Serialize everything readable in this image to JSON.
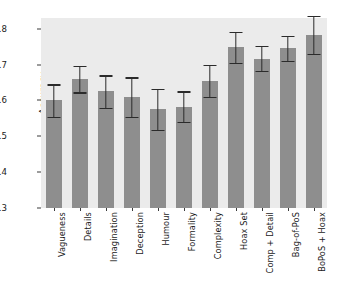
{
  "chart_data": {
    "type": "bar",
    "title": "",
    "xlabel": "",
    "ylabel": "Accuracy",
    "ylim": [
      0.3,
      0.83
    ],
    "yticks": [
      0.3,
      0.4,
      0.5,
      0.6,
      0.7,
      0.8
    ],
    "ytick_labels": [
      "0.3",
      "0.4",
      "0.5",
      "0.6",
      "0.7",
      "0.8"
    ],
    "grid": false,
    "legend": null,
    "categories": [
      "Vagueness",
      "Details",
      "Imagination",
      "Deception",
      "Humour",
      "Formality",
      "Complexity",
      "Hoax Set",
      "Comp + Detail",
      "Bag-of-PoS",
      "BoPoS + Hoax"
    ],
    "values": [
      0.6,
      0.66,
      0.625,
      0.61,
      0.575,
      0.583,
      0.655,
      0.748,
      0.717,
      0.745,
      0.783
    ],
    "errors": [
      0.045,
      0.037,
      0.045,
      0.055,
      0.057,
      0.042,
      0.045,
      0.043,
      0.035,
      0.035,
      0.053
    ],
    "bar_color": "#8e8e8e",
    "error_color": "#2b2b2b",
    "plot_background": "#ebebeb",
    "figure_background": "#ffffff"
  }
}
